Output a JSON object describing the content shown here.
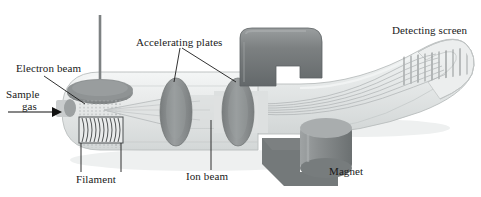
{
  "figure": {
    "type": "labeled-schematic-diagram",
    "background_color": "#ffffff",
    "text_color": "#1a1a1a"
  },
  "labels": {
    "electron_beam": "Electron beam",
    "sample_gas_line1": "Sample",
    "sample_gas_line2": "gas",
    "filament": "Filament",
    "accelerating_plates": "Accelerating plates",
    "ion_beam": "Ion beam",
    "magnet": "Magnet",
    "detecting_screen": "Detecting screen"
  },
  "icons": {
    "inlet_arrow": "right-arrow-icon",
    "electron_source_rod": "vertical-rod-icon",
    "filament_coil": "coil-icon"
  },
  "colors": {
    "chamber_body": "#e3e6e6",
    "chamber_outline": "#b9bdbd",
    "chamber_highlight": "#f2f4f4",
    "plate_gray": "#8e9192",
    "plate_gray_dark": "#75797a",
    "magnet_dark": "#6e7273",
    "magnet_mid": "#8a8e8f",
    "magnet_light": "#a7abac",
    "electron_disc": "#8c9090",
    "rod_gray": "#7d8182",
    "beam_line": "#b4b8b9",
    "spectral_line": "#9b9fa0",
    "leader_line": "#1a1a1a",
    "shadow": "#d7dada"
  },
  "components": {
    "ionization_chamber": "rounded capsule body at left",
    "electron_source": "disc with vertical rod on top of chamber",
    "filament": "horizontal coil inside chamber below electron beam",
    "sample_inlet": "small port on left wall with incoming arrow",
    "accelerating_plates": [
      "first gray elliptical plate",
      "second gray elliptical plate"
    ],
    "magnet_top": "hook shaped dark gray magnet above flight tube",
    "magnet_bottom": "cylindrical magnet below flight tube with L-shaped pole",
    "flight_tube": "tube curving upward to the right",
    "detecting_screen": "curved end of tube showing spectral lines"
  },
  "beams": {
    "electron_beam_dotted_lines": 14,
    "ion_beam_trajectories": 6,
    "spectral_lines_on_screen": 10
  }
}
